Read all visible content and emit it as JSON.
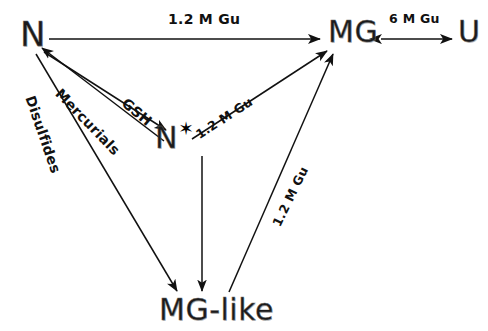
{
  "figure": {
    "background_color": "#ffffff",
    "ink_color": "#111111",
    "width": 488,
    "height": 331
  },
  "nodes": [
    {
      "id": "N",
      "label": "N",
      "star": "",
      "description": "native state",
      "x": 20,
      "y": 14,
      "font_size": 34
    },
    {
      "id": "N-star",
      "label": "N",
      "star": "✶",
      "description": "modified native-like state",
      "x": 155,
      "y": 120,
      "font_size": 30
    },
    {
      "id": "MG",
      "label": "MG",
      "star": "",
      "description": "molten globule",
      "x": 328,
      "y": 14,
      "font_size": 30
    },
    {
      "id": "U",
      "label": "U",
      "star": "",
      "description": "unfolded state",
      "x": 458,
      "y": 14,
      "font_size": 30
    },
    {
      "id": "MG-like",
      "label": "MG-like",
      "star": "",
      "description": "molten globule like state",
      "x": 159,
      "y": 292,
      "font_size": 30
    }
  ],
  "edges": [
    {
      "id": "n-to-mg",
      "from": "N",
      "to": "MG",
      "label": "1.2 M Gu",
      "direction": "forward",
      "label_x": 168,
      "label_y": 11,
      "label_rotation": 0
    },
    {
      "id": "mg-to-u",
      "from": "MG",
      "to": "U",
      "label": "6 M Gu",
      "direction": "bidirectional",
      "label_x": 389,
      "label_y": 11,
      "label_rotation": 0
    },
    {
      "id": "n-to-nstar",
      "from": "N",
      "to": "N-star",
      "label": "GSH",
      "direction": "forward",
      "label_x": 124,
      "label_y": 93,
      "label_rotation": 40
    },
    {
      "id": "nstar-to-n",
      "from": "N-star",
      "to": "N",
      "label": "Mercurials",
      "direction": "forward",
      "label_x": 58,
      "label_y": 83,
      "label_rotation": 46
    },
    {
      "id": "nstar-to-mg",
      "from": "N-star",
      "to": "MG",
      "label": "1.2 M Gu",
      "direction": "forward",
      "label_x": 197,
      "label_y": 128,
      "label_rotation": -33
    },
    {
      "id": "mglike-to-mg",
      "from": "MG-like",
      "to": "MG",
      "label": "1.2 M Gu",
      "direction": "forward",
      "label_x": 276,
      "label_y": 218,
      "label_rotation": -64
    },
    {
      "id": "n-to-mglike",
      "from": "N",
      "to": "MG-like",
      "label": "Disulfides",
      "direction": "forward",
      "label_x": 30,
      "label_y": 88,
      "label_rotation": 71
    },
    {
      "id": "nstar-to-mglike",
      "from": "N-star",
      "to": "MG-like",
      "label": "",
      "direction": "forward",
      "label_x": 0,
      "label_y": 0,
      "label_rotation": 0
    }
  ]
}
